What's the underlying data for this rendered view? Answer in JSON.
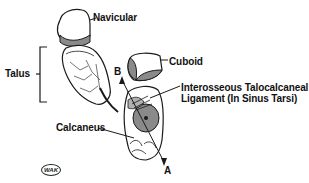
{
  "diagram": {
    "type": "anatomical-illustration",
    "labels": {
      "navicular": "Navicular",
      "cuboid": "Cuboid",
      "talus": "Talus",
      "ligament_line1": "Interosseous Talocalcaneal",
      "ligament_line2": "Ligament (In Sinus Tarsi)",
      "calcaneus": "Calcaneus",
      "axis_b": "B",
      "axis_a": "A"
    },
    "logo": "WAK",
    "colors": {
      "line": "#1a1a1a",
      "articular_surface": "#8a8a8a",
      "background": "#ffffff"
    }
  }
}
